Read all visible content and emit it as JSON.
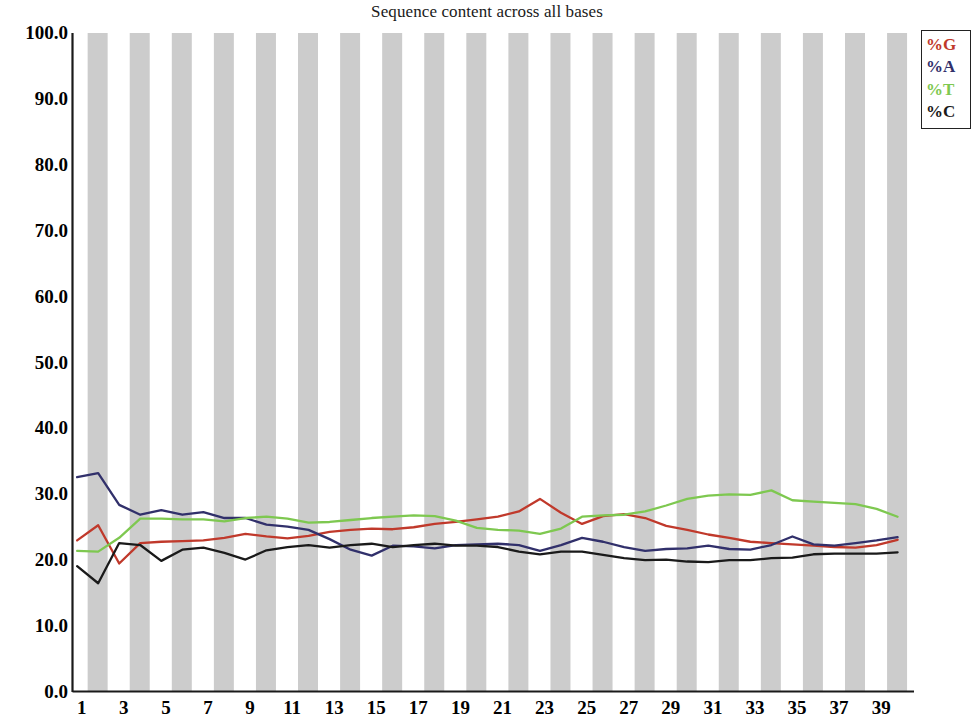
{
  "chart_data": {
    "type": "line",
    "title": "Sequence content across all bases",
    "xlabel": "",
    "ylabel": "",
    "ylim": [
      0.0,
      100.0
    ],
    "xlim": [
      1,
      40
    ],
    "grid": false,
    "background_bands": "alternating vertical grey bands at every other base position",
    "legend_position": "top-right",
    "ytick_labels": [
      "100.0",
      "90.0",
      "80.0",
      "70.0",
      "60.0",
      "50.0",
      "40.0",
      "30.0",
      "20.0",
      "10.0",
      "0.0"
    ],
    "ytick_values": [
      100.0,
      90.0,
      80.0,
      70.0,
      60.0,
      50.0,
      40.0,
      30.0,
      20.0,
      10.0,
      0.0
    ],
    "xtick_labels": [
      "1",
      "3",
      "5",
      "7",
      "9",
      "11",
      "13",
      "15",
      "17",
      "19",
      "21",
      "23",
      "25",
      "27",
      "29",
      "31",
      "33",
      "35",
      "37",
      "39"
    ],
    "xtick_values": [
      1,
      3,
      5,
      7,
      9,
      11,
      13,
      15,
      17,
      19,
      21,
      23,
      25,
      27,
      29,
      31,
      33,
      35,
      37,
      39
    ],
    "x": [
      1,
      2,
      3,
      4,
      5,
      6,
      7,
      8,
      9,
      10,
      11,
      12,
      13,
      14,
      15,
      16,
      17,
      18,
      19,
      20,
      21,
      22,
      23,
      24,
      25,
      26,
      27,
      28,
      29,
      30,
      31,
      32,
      33,
      34,
      35,
      36,
      37,
      38,
      39,
      40
    ],
    "series": [
      {
        "name": "%G",
        "color": "#c0392b",
        "values": [
          23.0,
          25.3,
          19.5,
          22.6,
          22.8,
          22.9,
          23.0,
          23.4,
          24.0,
          23.6,
          23.3,
          23.7,
          24.3,
          24.6,
          24.8,
          24.7,
          25.0,
          25.5,
          25.8,
          26.2,
          26.6,
          27.4,
          29.3,
          27.2,
          25.5,
          26.7,
          27.0,
          26.4,
          25.2,
          24.6,
          23.9,
          23.4,
          22.8,
          22.6,
          22.4,
          22.2,
          22.0,
          21.9,
          22.3,
          23.1
        ]
      },
      {
        "name": "%A",
        "color": "#31306b",
        "values": [
          32.6,
          33.2,
          28.4,
          26.9,
          27.6,
          26.9,
          27.3,
          26.4,
          26.4,
          25.4,
          25.1,
          24.6,
          23.2,
          21.6,
          20.7,
          22.2,
          22.1,
          21.8,
          22.3,
          22.4,
          22.5,
          22.3,
          21.4,
          22.3,
          23.4,
          22.8,
          22.0,
          21.4,
          21.7,
          21.8,
          22.2,
          21.7,
          21.6,
          22.3,
          23.6,
          22.4,
          22.2,
          22.6,
          23.0,
          23.5
        ]
      },
      {
        "name": "%T",
        "color": "#7ec850",
        "values": [
          21.4,
          21.3,
          23.4,
          26.3,
          26.3,
          26.2,
          26.2,
          25.9,
          26.4,
          26.6,
          26.3,
          25.7,
          25.8,
          26.1,
          26.4,
          26.6,
          26.8,
          26.7,
          26.0,
          24.9,
          24.6,
          24.5,
          24.0,
          24.8,
          26.6,
          26.8,
          26.9,
          27.4,
          28.3,
          29.3,
          29.8,
          30.0,
          29.9,
          30.6,
          29.1,
          28.9,
          28.7,
          28.5,
          27.8,
          26.6
        ]
      },
      {
        "name": "%C",
        "color": "#1a1a1a",
        "values": [
          19.1,
          16.5,
          22.6,
          22.3,
          19.9,
          21.6,
          21.9,
          21.1,
          20.1,
          21.5,
          22.0,
          22.3,
          21.9,
          22.3,
          22.5,
          22.0,
          22.3,
          22.5,
          22.2,
          22.2,
          22.0,
          21.3,
          20.9,
          21.3,
          21.3,
          20.8,
          20.3,
          20.0,
          20.1,
          19.8,
          19.7,
          20.0,
          20.0,
          20.3,
          20.4,
          20.9,
          21.0,
          21.0,
          21.0,
          21.2
        ]
      }
    ]
  },
  "legend": {
    "entries": [
      {
        "label": "%G",
        "color": "#c0392b"
      },
      {
        "label": "%A",
        "color": "#31306b"
      },
      {
        "label": "%T",
        "color": "#7ec850"
      },
      {
        "label": "%C",
        "color": "#1a1a1a"
      }
    ]
  },
  "axes": {
    "axis_color": "#1a1a1a",
    "band_color": "#cccccc"
  }
}
